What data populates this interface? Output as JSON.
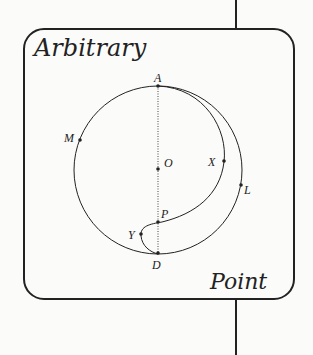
{
  "diagram": {
    "title_top": "Arbitrary",
    "title_bottom": "Point",
    "points": {
      "A": "A",
      "M": "M",
      "O": "O",
      "X": "X",
      "L": "L",
      "P": "P",
      "Y": "Y",
      "D": "D"
    },
    "colors": {
      "stroke": "#222222",
      "background": "#fbfbfa"
    }
  }
}
